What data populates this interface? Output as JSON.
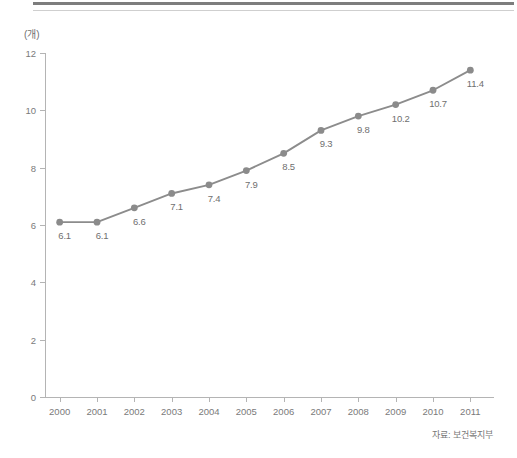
{
  "figure": {
    "unit_label": "(개)",
    "source_note": "자료: 보건복지부",
    "line_color": "#8c8c8c",
    "marker_color": "#8b8b8b",
    "axis_color": "#b4b4b4",
    "text_color": "#7a7a7a",
    "rule_color": "#7d7d7d"
  },
  "chart_data": {
    "type": "line",
    "title": "",
    "subtitle": "",
    "xlabel": "",
    "ylabel": "(개)",
    "unit": "개",
    "source": "자료: 보건복지부",
    "categories": [
      "2000",
      "2001",
      "2002",
      "2003",
      "2004",
      "2005",
      "2006",
      "2007",
      "2008",
      "2009",
      "2010",
      "2011"
    ],
    "values": [
      6.1,
      6.1,
      6.6,
      7.1,
      7.4,
      7.9,
      8.5,
      9.3,
      9.8,
      10.2,
      10.7,
      11.4
    ],
    "point_labels": [
      "6.1",
      "6.1",
      "6.6",
      "7.1",
      "7.4",
      "7.9",
      "8.5",
      "9.3",
      "9.8",
      "10.2",
      "10.7",
      "11.4"
    ],
    "ylim": [
      0,
      12
    ],
    "yticks": [
      0,
      2,
      4,
      6,
      8,
      10,
      12
    ],
    "ytick_labels": [
      "0",
      "2",
      "4",
      "6",
      "8",
      "10",
      "12"
    ],
    "xlim": [
      "2000",
      "2011"
    ],
    "grid": false,
    "legend": null,
    "markers": "circle",
    "series": [
      {
        "name": "",
        "values": [
          6.1,
          6.1,
          6.6,
          7.1,
          7.4,
          7.9,
          8.5,
          9.3,
          9.8,
          10.2,
          10.7,
          11.4
        ]
      }
    ]
  }
}
